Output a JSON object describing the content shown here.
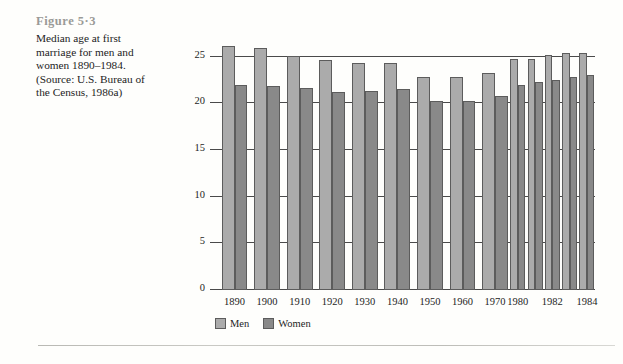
{
  "figure": {
    "number_label": "Figure 5·3",
    "caption": "Median age at first marriage for men and women 1890–1984. (Source: U.S. Bureau of the Census, 1986a)"
  },
  "legend": {
    "position": "bottom-center",
    "items": [
      {
        "label": "Men",
        "color": "#ababab"
      },
      {
        "label": "Women",
        "color": "#898989"
      }
    ]
  },
  "chart_data": {
    "type": "bar",
    "title": "",
    "xlabel": "",
    "ylabel": "",
    "ylim": [
      0,
      27
    ],
    "yticks": [
      0,
      5,
      10,
      15,
      20,
      25
    ],
    "grid": true,
    "categories": [
      "1890",
      "1900",
      "1910",
      "1920",
      "1930",
      "1940",
      "1950",
      "1960",
      "1970",
      "1980",
      "1981",
      "1982",
      "1983",
      "1984"
    ],
    "tick_labels": [
      "1890",
      "1900",
      "1910",
      "1920",
      "1930",
      "1940",
      "1950",
      "1960",
      "1970",
      "1980",
      "",
      "1982",
      "",
      "1984"
    ],
    "series": [
      {
        "name": "Men",
        "color": "#ababab",
        "values": [
          26.1,
          25.9,
          25.1,
          24.6,
          24.3,
          24.3,
          22.8,
          22.8,
          23.2,
          24.7,
          24.8,
          25.2,
          25.4,
          25.4
        ]
      },
      {
        "name": "Women",
        "color": "#898989",
        "values": [
          22.0,
          21.9,
          21.6,
          21.2,
          21.3,
          21.5,
          20.3,
          20.3,
          20.8,
          22.0,
          22.3,
          22.5,
          22.8,
          23.0
        ]
      }
    ]
  }
}
